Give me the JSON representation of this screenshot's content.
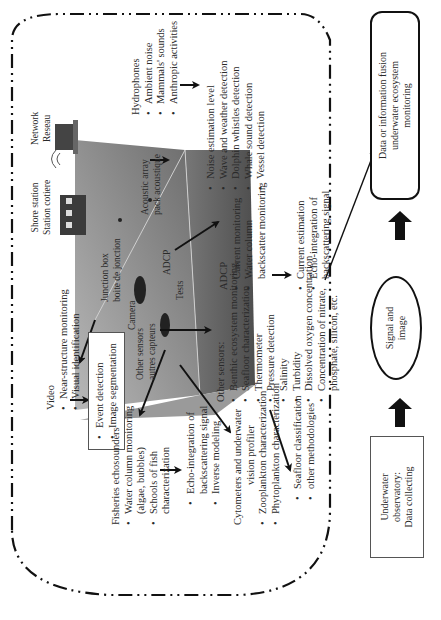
{
  "diagram": {
    "flow": {
      "observatory": "Underwater observatory: Data collecting",
      "observatory_lines": [
        "Underwater",
        "observatory:",
        "Data collecting"
      ],
      "signal": "Signal and image",
      "signal_lines": [
        "Signal and",
        "image"
      ],
      "fusion": "Data or information fusion underwater ecosystem monitoring",
      "fusion_lines": [
        "Data or information fusion",
        "underwater ecosystem",
        "monitoring"
      ]
    },
    "observatory_image_labels": {
      "shore_station": [
        "Shore station",
        "Station cotiere"
      ],
      "network": [
        "Network",
        "Reseau"
      ],
      "junction_box": [
        "Junction box",
        "boite de jonction"
      ],
      "camera": "Camera",
      "other_sensors": [
        "Other sensors",
        "autres capteurs"
      ],
      "acoustic_array": [
        "Acoustic array",
        "pack acoustique"
      ],
      "adcp": "ADCP",
      "tests": "Tests"
    },
    "video": {
      "title": "Video",
      "items": [
        "Near-structure monitoring",
        "Visual identification"
      ],
      "result_items": [
        "Event detection",
        "Image segmentation"
      ]
    },
    "hydrophones": {
      "title": "Hydrophones",
      "items": [
        "Ambient noise",
        "Mammals' sounds",
        "Anthropic activities"
      ],
      "result_items": [
        "Noise estimation level",
        "Wave and weather detection",
        "Dolphin whistles detection",
        "Whale sound detection",
        "Vessel detection"
      ]
    },
    "adcp": {
      "title": "ADCP",
      "items": [
        "Current monitoring",
        "Water column backscatter monitoring"
      ],
      "item2_lines": [
        "Water column",
        "backscatter monitoring"
      ],
      "result_items": [
        "Current estimation",
        "Echo-integration of backscattering signal"
      ],
      "result2_lines": [
        "Echo-integration of",
        "backscattering signal"
      ]
    },
    "other_sensors": {
      "title": "Other sensors:",
      "items": [
        "Benthic ecosystem monitoring",
        "Seafloor characterization",
        "Thermometer",
        "Pressure detection",
        "Salinity",
        "Turbidity",
        "Dissolved oxygen concentration",
        "Concentration of nitrate, phosphate, silicon, etc."
      ],
      "last_lines": [
        "Concentration of nitrate,",
        "phosphate, silicon, etc."
      ],
      "result_items": [
        "Seafloor classification",
        "other methodologies"
      ]
    },
    "fisheries": {
      "title": "Fisheries echosounders",
      "items": [
        "Water column monitoring (algae, bubbles)",
        "Schools of fish characterization"
      ],
      "item1_lines": [
        "Water column monitoring",
        "(algae, bubbles)"
      ],
      "item2_lines": [
        "Schools of fish",
        "characterization"
      ],
      "result_items": [
        "Echo-integration of backscattering signal",
        "Inverse modeling"
      ],
      "result1_lines": [
        "Echo-integration of",
        "backscattering signal"
      ]
    },
    "cytometers": {
      "title_lines": [
        "Cytometers and underwater",
        "vision profiler"
      ],
      "items": [
        "Zooplankton characterization",
        "Phytoplankton characterization"
      ]
    },
    "colors": {
      "line": "#111111",
      "text": "#2a2a2a",
      "seafloor_dark": "#5e5e5e",
      "seafloor_light": "#a8a8a8"
    }
  }
}
